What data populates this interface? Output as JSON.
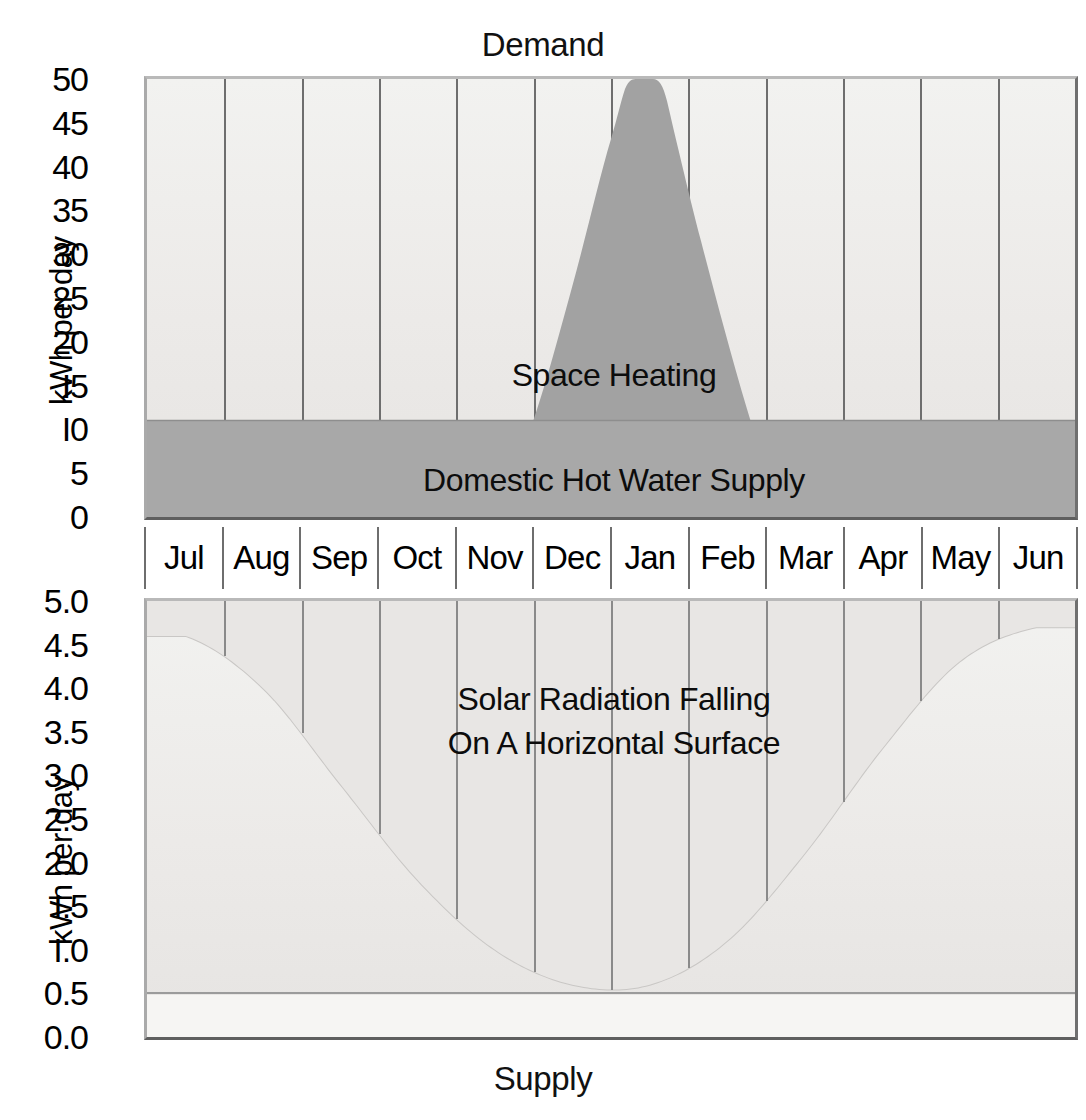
{
  "demand": {
    "title": "Demand",
    "ylabel": "kWh per day",
    "yticks": [
      "50",
      "45",
      "40",
      "35",
      "30",
      "25",
      "20",
      "I5",
      "I0",
      "5",
      "0"
    ],
    "series_labels": {
      "space_heating": "Space Heating",
      "hot_water": "Domestic Hot Water Supply"
    }
  },
  "supply": {
    "title": "Supply",
    "ylabel": "kWh per day",
    "yticks": [
      "5.0",
      "4.5",
      "4.0",
      "3.5",
      "3.0",
      "2.5",
      "2.0",
      "I.5",
      "I.0",
      "0.5",
      "0.0"
    ],
    "series_labels": {
      "solar_line1": "Solar Radiation Falling",
      "solar_line2": "On A Horizontal Surface"
    }
  },
  "months": [
    "Jul",
    "Aug",
    "Sep",
    "Oct",
    "Nov",
    "Dec",
    "Jan",
    "Feb",
    "Mar",
    "Apr",
    "May",
    "Jun"
  ],
  "colors": {
    "space_heating_fill": "#a2a2a2",
    "hot_water_fill": "#a8a8a8",
    "plot_background": "#ededeb",
    "gridline": "#6e6e6e",
    "frame": "#7d7d7d",
    "text": "#000000",
    "supply_fill": "#e3e1df"
  },
  "chart_data": [
    {
      "type": "area",
      "id": "demand-chart",
      "title": "Demand",
      "xlabel": "",
      "ylabel": "kWh per day",
      "ylim": [
        0,
        50
      ],
      "ytick_step": 5,
      "grid": true,
      "legend": "inline-labels",
      "categories": [
        "Jul",
        "Aug",
        "Sep",
        "Oct",
        "Nov",
        "Dec",
        "Jan",
        "Feb",
        "Mar",
        "Apr",
        "May",
        "Jun"
      ],
      "series": [
        {
          "name": "Domestic Hot Water Supply",
          "stacked": true,
          "note": "Constant band from 0 to 11 kWh per day across all months",
          "values": [
            11,
            11,
            11,
            11,
            11,
            11,
            11,
            11,
            11,
            11,
            11,
            11
          ]
        },
        {
          "name": "Space Heating",
          "stacked": true,
          "note": "Additional demand above the hot water band; zero Jul-Sep and May-Jun, peaking above the 50 kWh top of scale at the Dec/Jan boundary",
          "values": [
            0,
            0,
            0,
            2,
            14,
            33,
            33,
            20,
            6,
            0,
            0,
            0
          ],
          "peak_total_clipped_at": 50,
          "total_with_hot_water": [
            11,
            11,
            11,
            13,
            25,
            44,
            44,
            31,
            17,
            11,
            11,
            11
          ]
        }
      ]
    },
    {
      "type": "area",
      "id": "supply-chart",
      "title": "Supply",
      "xlabel": "",
      "ylabel": "kWh per day",
      "ylim": [
        0.0,
        5.0
      ],
      "ytick_step": 0.5,
      "grid": true,
      "legend": "inline-labels",
      "categories": [
        "Jul",
        "Aug",
        "Sep",
        "Oct",
        "Nov",
        "Dec",
        "Jan",
        "Feb",
        "Mar",
        "Apr",
        "May",
        "Jun"
      ],
      "series": [
        {
          "name": "Solar Radiation Falling On A Horizontal Surface",
          "note": "U-shaped annual curve; high in summer, minimum around Dec/Jan",
          "values": [
            4.6,
            4.0,
            2.9,
            1.8,
            1.0,
            0.6,
            0.6,
            1.1,
            2.1,
            3.3,
            4.3,
            4.7
          ]
        }
      ]
    }
  ]
}
